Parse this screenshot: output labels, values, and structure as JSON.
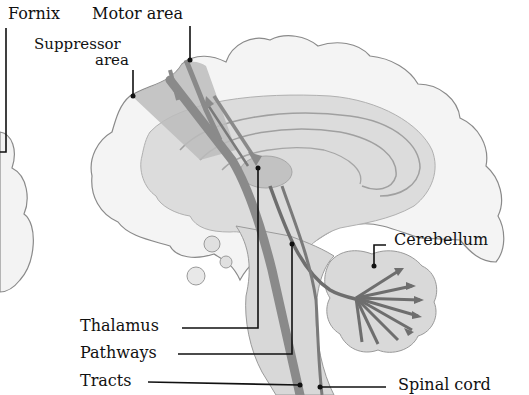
{
  "diagram": {
    "labels": {
      "fornix": "Fornix",
      "motor_area": "Motor area",
      "suppressor_area_line1": "Suppressor",
      "suppressor_area_line2": "area",
      "cerebellum": "Cerebellum",
      "thalamus": "Thalamus",
      "pathways": "Pathways",
      "tracts": "Tracts",
      "spinal_cord": "Spinal cord"
    },
    "colors": {
      "cortex_fill": "#f2f2f2",
      "cortex_outline": "#8a8a8a",
      "inner_fill": "#d9d9d9",
      "pathway": "#8c8c8c",
      "pathway_dark": "#6e6e6e",
      "motor_shade": "#b8b8b8",
      "leader": "#111111"
    }
  }
}
